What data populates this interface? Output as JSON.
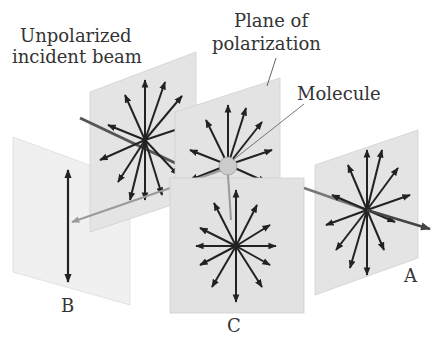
{
  "labels": {
    "unpolarized_line1": "Unpolarized",
    "unpolarized_line2": "incident beam",
    "plane_line1": "Plane of",
    "plane_line2": "polarization",
    "molecule": "Molecule",
    "panel_a": "A",
    "panel_b": "B",
    "panel_c": "C"
  },
  "colors": {
    "panel_fill": "#e3e3e3",
    "panel_fill_light": "#efefef",
    "panel_stroke": "#cfcfcf",
    "arrow": "#222222",
    "beam": "#555555",
    "beam_scattered": "#9a9a9a",
    "molecule_fill": "#c8c8c8",
    "text": "#333333"
  },
  "panels": [
    {
      "id": "incident",
      "description": "Unpolarized incident beam plane with radial E-field arrows"
    },
    {
      "id": "molecule-plane",
      "description": "Plane of polarization containing the molecule"
    },
    {
      "id": "A",
      "description": "Forward-scattered: unpolarized (radial arrows)"
    },
    {
      "id": "B",
      "description": "Side-scattered at 90°: linearly polarized (vertical arrow)"
    },
    {
      "id": "C",
      "description": "Intermediate scattering: unpolarized (radial arrows)"
    }
  ]
}
